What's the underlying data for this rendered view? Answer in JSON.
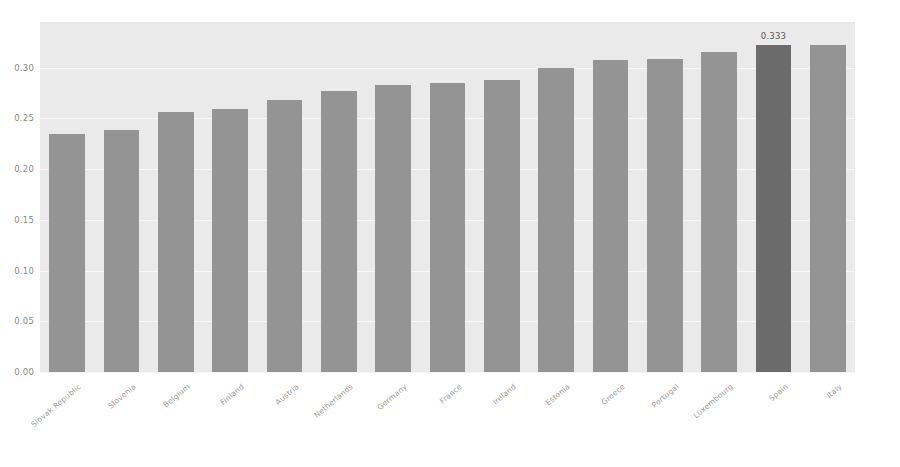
{
  "chart_data": {
    "type": "bar",
    "title": "",
    "subtitle": "",
    "xlabel": "",
    "ylabel": "",
    "categories": [
      "Slovak Republic",
      "Slovenia",
      "Belgium",
      "Finland",
      "Austria",
      "Netherlands",
      "Germany",
      "France",
      "Ireland",
      "Estonia",
      "Greece",
      "Portugal",
      "Luxembourg",
      "Spain",
      "Italy"
    ],
    "values": [
      0.235,
      0.239,
      0.256,
      0.259,
      0.268,
      0.277,
      0.283,
      0.285,
      0.288,
      0.3,
      0.308,
      0.309,
      0.315,
      0.322,
      0.322
    ],
    "data_labels": {
      "Spain": "0.333"
    },
    "highlighted_category": "Spain",
    "ylim": [
      0.0,
      0.345
    ],
    "yticks": [
      0.0,
      0.05,
      0.1,
      0.15,
      0.2,
      0.25,
      0.3
    ],
    "ytick_labels": [
      "0.00",
      "0.05",
      "0.10",
      "0.15",
      "0.20",
      "0.25",
      "0.30"
    ],
    "grid": true,
    "legend": false,
    "legend_position": "none",
    "colors": {
      "bar": "#949494",
      "bar_highlight": "#6b6b6b",
      "plot_background": "#eaeaea",
      "figure_background": "#ffffff",
      "gridline": "#f7f7f7",
      "tick_text": "#8a8a8a",
      "xtick_text": "#9b9b9b",
      "data_label_text": "#5a5a5a"
    }
  }
}
